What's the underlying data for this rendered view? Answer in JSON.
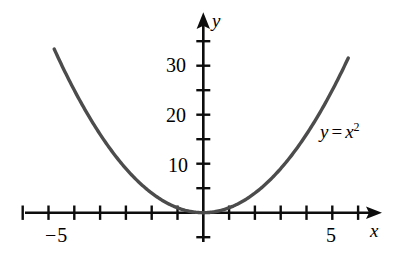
{
  "chart_data": {
    "type": "line",
    "title": "",
    "function": "y = x^2",
    "annotation": {
      "text": "y = x²",
      "lhs": "y",
      "operator": "=",
      "base": "x",
      "exponent": "2",
      "x_data": 5.1,
      "y_data": 17
    },
    "xlabel": "x",
    "ylabel": "y",
    "xlim": [
      -7.0,
      6.85
    ],
    "ylim": [
      -2.2,
      41.0
    ],
    "x_ticks": [
      -7,
      -6,
      -5,
      -4,
      -3,
      -2,
      -1,
      1,
      2,
      3,
      4,
      5,
      6
    ],
    "y_ticks": [
      -5,
      5,
      10,
      15,
      20,
      25,
      30,
      35
    ],
    "x_tick_labels": [
      {
        "value": -5,
        "label": "−5"
      },
      {
        "value": 5,
        "label": "5"
      }
    ],
    "y_tick_labels": [
      {
        "value": 10,
        "label": "10"
      },
      {
        "value": 20,
        "label": "20"
      },
      {
        "value": 30,
        "label": "30"
      }
    ],
    "grid": false,
    "legend": false,
    "axis_arrows": {
      "x": "right",
      "y": "up"
    },
    "series": [
      {
        "name": "y = x²",
        "color": "#4c4c4c",
        "line_width": 3.4,
        "x_domain": [
          -5.78,
          5.62
        ],
        "points": [
          {
            "x": -5.78,
            "y": 33.4
          },
          {
            "x": -5.5,
            "y": 30.25
          },
          {
            "x": -5.0,
            "y": 25.0
          },
          {
            "x": -4.5,
            "y": 20.25
          },
          {
            "x": -4.0,
            "y": 16.0
          },
          {
            "x": -3.5,
            "y": 12.25
          },
          {
            "x": -3.0,
            "y": 9.0
          },
          {
            "x": -2.5,
            "y": 6.25
          },
          {
            "x": -2.0,
            "y": 4.0
          },
          {
            "x": -1.5,
            "y": 2.25
          },
          {
            "x": -1.0,
            "y": 1.0
          },
          {
            "x": -0.5,
            "y": 0.25
          },
          {
            "x": 0.0,
            "y": 0.0
          },
          {
            "x": 0.5,
            "y": 0.25
          },
          {
            "x": 1.0,
            "y": 1.0
          },
          {
            "x": 1.5,
            "y": 2.25
          },
          {
            "x": 2.0,
            "y": 4.0
          },
          {
            "x": 2.5,
            "y": 6.25
          },
          {
            "x": 3.0,
            "y": 9.0
          },
          {
            "x": 3.5,
            "y": 12.25
          },
          {
            "x": 4.0,
            "y": 16.0
          },
          {
            "x": 4.5,
            "y": 20.25
          },
          {
            "x": 5.0,
            "y": 25.0
          },
          {
            "x": 5.5,
            "y": 30.25
          },
          {
            "x": 5.62,
            "y": 31.6
          }
        ]
      }
    ],
    "colors": {
      "axis": "#0d0d0d",
      "curve": "#4c4c4c",
      "text": "#000000",
      "background": "#ffffff"
    }
  },
  "labels": {
    "y_30": "30",
    "y_20": "20",
    "y_10": "10",
    "x_neg5": "−5",
    "x_5": "5",
    "axis_x": "x",
    "axis_y": "y",
    "annotation_lhs": "y",
    "annotation_op": "=",
    "annotation_base": "x",
    "annotation_exp": "2"
  }
}
